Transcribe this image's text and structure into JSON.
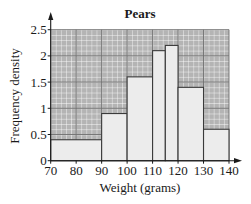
{
  "chart_data": {
    "type": "bar",
    "subtype": "histogram",
    "title": "Pears",
    "xlabel": "Weight (grams)",
    "ylabel": "Frequency density",
    "xlim": [
      70,
      140
    ],
    "ylim": [
      0,
      2.5
    ],
    "x_ticks": [
      70,
      80,
      90,
      100,
      110,
      120,
      130,
      140
    ],
    "y_ticks": [
      "0",
      "0.5",
      "1",
      "1.5",
      "2",
      "2.5"
    ],
    "grid": true,
    "legend": null,
    "bins": [
      {
        "start": 70,
        "end": 90,
        "value": 0.4
      },
      {
        "start": 90,
        "end": 100,
        "value": 0.9
      },
      {
        "start": 100,
        "end": 110,
        "value": 1.6
      },
      {
        "start": 110,
        "end": 115,
        "value": 2.1
      },
      {
        "start": 115,
        "end": 120,
        "value": 2.2
      },
      {
        "start": 120,
        "end": 130,
        "value": 1.4
      },
      {
        "start": 130,
        "end": 140,
        "value": 0.6
      }
    ],
    "categories": [
      "70-90",
      "90-100",
      "100-110",
      "110-115",
      "115-120",
      "120-130",
      "130-140"
    ],
    "values": [
      0.4,
      0.9,
      1.6,
      2.1,
      2.2,
      1.4,
      0.6
    ]
  },
  "colors": {
    "grid_background": "#b4b4b4",
    "grid_minor": "#ffffff",
    "grid_major": "#6e6e6e",
    "bar_fill": "#ececec",
    "bar_stroke": "#3a3a3a",
    "axis": "#1a1a1a",
    "text": "#1a1a1a"
  }
}
